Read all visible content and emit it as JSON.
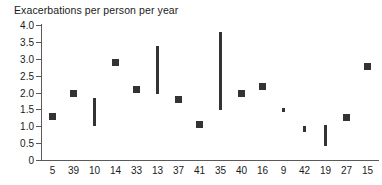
{
  "chart_data": {
    "type": "scatter",
    "title": "Exacerbations per person per year",
    "xlabel": "",
    "ylabel": "",
    "ylim": [
      0,
      4.0
    ],
    "grid": false,
    "legend": null,
    "y_ticks": [
      "0",
      "0.5",
      "1.0",
      "1.5",
      "2.0",
      "2.5",
      "3.0",
      "3.5",
      "4.0"
    ],
    "y_tick_values": [
      0,
      0.5,
      1.0,
      1.5,
      2.0,
      2.5,
      3.0,
      3.5,
      4.0
    ],
    "categories": [
      "5",
      "39",
      "10",
      "14",
      "33",
      "13",
      "37",
      "41",
      "35",
      "40",
      "16",
      "9",
      "42",
      "19",
      "27",
      "15"
    ],
    "points": [
      {
        "category": "5",
        "marker": "square",
        "value": 1.28
      },
      {
        "category": "39",
        "marker": "square",
        "value": 1.98
      },
      {
        "category": "10",
        "marker": "bar",
        "low": 1.0,
        "high": 1.85
      },
      {
        "category": "14",
        "marker": "square",
        "value": 2.88
      },
      {
        "category": "33",
        "marker": "square",
        "value": 2.08
      },
      {
        "category": "13",
        "marker": "bar",
        "low": 1.97,
        "high": 3.38
      },
      {
        "category": "37",
        "marker": "square",
        "value": 1.78
      },
      {
        "category": "41",
        "marker": "square",
        "value": 1.06
      },
      {
        "category": "35",
        "marker": "bar",
        "low": 1.47,
        "high": 3.78
      },
      {
        "category": "40",
        "marker": "square",
        "value": 1.97
      },
      {
        "category": "16",
        "marker": "square",
        "value": 2.18
      },
      {
        "category": "9",
        "marker": "bar",
        "low": 1.43,
        "high": 1.53
      },
      {
        "category": "42",
        "marker": "bar",
        "low": 0.83,
        "high": 1.0
      },
      {
        "category": "19",
        "marker": "bar",
        "low": 0.42,
        "high": 1.04
      },
      {
        "category": "27",
        "marker": "square",
        "value": 1.27
      },
      {
        "category": "15",
        "marker": "square",
        "value": 2.78
      }
    ],
    "colors": {
      "marker": "#333333",
      "axis": "#5a5a5a",
      "text": "#1a1a1a",
      "background": "#ffffff"
    }
  }
}
